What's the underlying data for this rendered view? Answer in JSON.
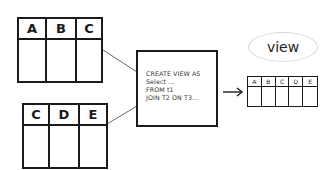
{
  "diagram": {
    "source_tables": [
      {
        "name": "t1",
        "columns": [
          "A",
          "B",
          "C"
        ]
      },
      {
        "name": "t2",
        "columns": [
          "C",
          "D",
          "E"
        ]
      }
    ],
    "query": {
      "lines": [
        "CREATE VIEW AS",
        "Select ...",
        "FROM t1",
        "JOIN T2 ON T3..."
      ]
    },
    "result": {
      "label": "view",
      "columns": [
        "A",
        "B",
        "C",
        "D",
        "E"
      ]
    },
    "colors": {
      "ink": "#1a1a1a",
      "ellipse": "#d8d8d8",
      "background": "#ffffff"
    }
  }
}
